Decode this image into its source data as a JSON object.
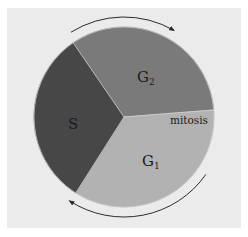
{
  "chart_data": {
    "type": "pie",
    "title": "",
    "direction": "clockwise",
    "start_angle_deg": 235.6,
    "segments": [
      {
        "name": "G2",
        "label_main": "G",
        "label_sub": "2",
        "degrees": 119.9,
        "color": "#7a7a7a"
      },
      {
        "name": "mitosis",
        "label_main": "mitosis",
        "label_sub": "",
        "degrees": 4.5,
        "color": "#b2b2b2"
      },
      {
        "name": "G1",
        "label_main": "G",
        "label_sub": "1",
        "degrees": 122.4,
        "color": "#b2b2b2"
      },
      {
        "name": "S",
        "label_main": "S",
        "label_sub": "",
        "degrees": 113.2,
        "color": "#474747"
      }
    ],
    "cycle_arrows": [
      {
        "position": "top",
        "direction": "clockwise"
      },
      {
        "position": "bottom",
        "direction": "clockwise"
      }
    ]
  },
  "colors": {
    "panel": "#ebebeb",
    "background": "#ffffff",
    "arrow": "#2a2a2a",
    "edge": "#d6d6d6"
  }
}
